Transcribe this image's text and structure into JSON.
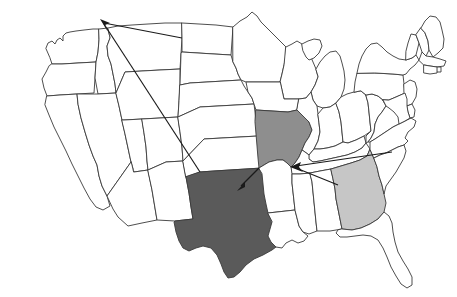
{
  "figure": {
    "type": "choropleth-flow-map",
    "region": "United States (contiguous 48 states)",
    "title": "",
    "background_color": "#ffffff",
    "border_color": "#3a3a3a",
    "arrow_color": "#1a1a1a"
  },
  "legend_colors": {
    "dark_gray": "#5a5a5a",
    "medium_gray": "#8e8e8e",
    "light_gray": "#c6c6c6",
    "unshaded": "#ffffff"
  },
  "highlighted_states": [
    {
      "code": "TX",
      "name": "Texas",
      "shade": "dark",
      "color": "#5a5a5a"
    },
    {
      "code": "MO",
      "name": "Missouri",
      "shade": "medium",
      "color": "#8e8e8e"
    },
    {
      "code": "GA",
      "name": "Georgia",
      "shade": "light",
      "color": "#c6c6c6"
    }
  ],
  "flows": [
    {
      "id": "flow-tx-to-northwest",
      "from": "Texas panhandle",
      "to": "Idaho / Montana northern border",
      "from_xy": [
        200,
        172
      ],
      "to_xy": [
        101,
        20
      ],
      "arrowhead_at": "to"
    },
    {
      "id": "flow-upper-to-northwest",
      "from": "Northern plains",
      "to": "Idaho / Montana northern border",
      "from_xy": [
        182,
        38
      ],
      "to_xy": [
        101,
        20
      ],
      "arrowhead_at": "to"
    },
    {
      "id": "flow-mo-to-tx",
      "from": "Missouri southwest corner",
      "to": "Texas northeast",
      "from_xy": [
        259,
        168
      ],
      "to_xy": [
        239,
        189
      ],
      "arrowhead_at": "to"
    },
    {
      "id": "flow-east-to-mo",
      "from": "Virginia / North Carolina coast",
      "to": "Missouri southeast",
      "from_xy": [
        392,
        152
      ],
      "to_xy": [
        291,
        167
      ],
      "arrowhead_at": "to"
    },
    {
      "id": "flow-ga-to-mo",
      "from": "Georgia",
      "to": "Missouri southeast",
      "from_xy": [
        338,
        185
      ],
      "to_xy": [
        291,
        167
      ],
      "arrowhead_at": "to"
    }
  ],
  "state_labels": [],
  "annotations": []
}
